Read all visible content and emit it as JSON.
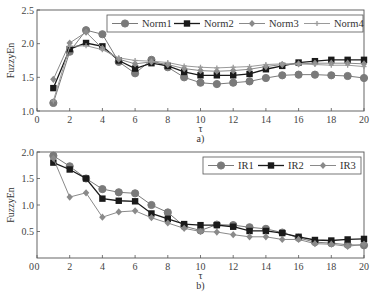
{
  "chart_data": [
    {
      "panel": "a)",
      "type": "line",
      "xlabel": "τ",
      "ylabel": "FuzzyEn",
      "xlim": [
        0,
        20
      ],
      "ylim": [
        1.0,
        2.5
      ],
      "xticks": [
        0,
        2,
        4,
        6,
        8,
        10,
        12,
        14,
        16,
        18,
        20
      ],
      "yticks": [
        "1.0",
        "1.5",
        "2.0",
        "2.5"
      ],
      "grid": false,
      "legend_position": "upper right",
      "x": [
        1,
        2,
        3,
        4,
        5,
        6,
        7,
        8,
        9,
        10,
        11,
        12,
        13,
        14,
        15,
        16,
        17,
        18,
        19,
        20
      ],
      "series": [
        {
          "name": "Norm1",
          "marker": "circle",
          "color": "#7a7a7a",
          "values": [
            1.12,
            1.88,
            2.2,
            2.14,
            1.73,
            1.56,
            1.76,
            1.65,
            1.5,
            1.42,
            1.4,
            1.42,
            1.44,
            1.49,
            1.53,
            1.54,
            1.54,
            1.53,
            1.52,
            1.49
          ]
        },
        {
          "name": "Norm2",
          "marker": "square",
          "color": "#1a1a1a",
          "values": [
            1.34,
            1.92,
            2.01,
            1.96,
            1.75,
            1.63,
            1.71,
            1.67,
            1.58,
            1.53,
            1.53,
            1.53,
            1.55,
            1.62,
            1.67,
            1.72,
            1.74,
            1.76,
            1.76,
            1.76
          ]
        },
        {
          "name": "Norm3",
          "marker": "diamond",
          "color": "#8a8a8a",
          "values": [
            1.47,
            2.01,
            2.17,
            1.93,
            1.77,
            1.7,
            1.73,
            1.69,
            1.63,
            1.6,
            1.59,
            1.6,
            1.62,
            1.66,
            1.69,
            1.7,
            1.71,
            1.71,
            1.71,
            1.7
          ]
        },
        {
          "name": "Norm4",
          "marker": "plus",
          "color": "#9a9a9a",
          "values": [
            1.15,
            1.96,
            1.97,
            1.91,
            1.79,
            1.75,
            1.74,
            1.72,
            1.67,
            1.65,
            1.64,
            1.65,
            1.66,
            1.69,
            1.7,
            1.7,
            1.69,
            1.68,
            1.68,
            1.66
          ]
        }
      ]
    },
    {
      "panel": "b)",
      "type": "line",
      "xlabel": "τ",
      "ylabel": "FuzzyEn",
      "xlim": [
        0,
        20
      ],
      "ylim": [
        0,
        2.0
      ],
      "xticks": [
        0,
        2,
        4,
        6,
        8,
        10,
        12,
        14,
        16,
        18,
        20
      ],
      "yticks": [
        "0",
        "0.5",
        "1.0",
        "1.5",
        "2.0"
      ],
      "grid": false,
      "legend_position": "upper right",
      "x": [
        1,
        2,
        3,
        4,
        5,
        6,
        7,
        8,
        9,
        10,
        11,
        12,
        13,
        14,
        15,
        16,
        17,
        18,
        19,
        20
      ],
      "series": [
        {
          "name": "IR1",
          "marker": "circle",
          "color": "#7a7a7a",
          "values": [
            1.93,
            1.73,
            1.5,
            1.3,
            1.24,
            1.22,
            1.0,
            0.86,
            0.6,
            0.52,
            0.63,
            0.62,
            0.58,
            0.55,
            0.48,
            0.38,
            0.3,
            0.28,
            0.25,
            0.24
          ]
        },
        {
          "name": "IR2",
          "marker": "square",
          "color": "#1a1a1a",
          "values": [
            1.8,
            1.67,
            1.5,
            1.12,
            1.08,
            1.07,
            0.84,
            0.74,
            0.64,
            0.62,
            0.62,
            0.59,
            0.51,
            0.51,
            0.47,
            0.4,
            0.34,
            0.33,
            0.35,
            0.36
          ]
        },
        {
          "name": "IR3",
          "marker": "diamond",
          "color": "#8a8a8a",
          "values": [
            1.88,
            1.15,
            1.23,
            0.77,
            0.87,
            0.89,
            0.76,
            0.66,
            0.56,
            0.5,
            0.49,
            0.44,
            0.4,
            0.4,
            0.35,
            0.35,
            0.27,
            0.26,
            0.22,
            0.26
          ]
        }
      ]
    }
  ],
  "panels": {
    "a": {
      "caption": "a)",
      "xlabel": "τ",
      "ylabel": "FuzzyEn"
    },
    "b": {
      "caption": "b)",
      "xlabel": "τ",
      "ylabel": "FuzzyEn"
    }
  }
}
